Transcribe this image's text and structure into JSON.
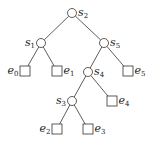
{
  "diagram": {
    "type": "binary-tree",
    "internal_nodes": [
      {
        "id": "s2",
        "base": "s",
        "sub": "2",
        "x": 72,
        "y": 13,
        "label_side": "right"
      },
      {
        "id": "s1",
        "base": "s",
        "sub": "1",
        "x": 41,
        "y": 43,
        "label_side": "left"
      },
      {
        "id": "s5",
        "base": "s",
        "sub": "5",
        "x": 104,
        "y": 43,
        "label_side": "right"
      },
      {
        "id": "s4",
        "base": "s",
        "sub": "4",
        "x": 88,
        "y": 72,
        "label_side": "right"
      },
      {
        "id": "s3",
        "base": "s",
        "sub": "3",
        "x": 72,
        "y": 101,
        "label_side": "left"
      }
    ],
    "leaves": [
      {
        "id": "e0",
        "base": "e",
        "sub": "0",
        "x": 25,
        "y": 71,
        "label_side": "left"
      },
      {
        "id": "e1",
        "base": "e",
        "sub": "1",
        "x": 57,
        "y": 71,
        "label_side": "right"
      },
      {
        "id": "e5",
        "base": "e",
        "sub": "5",
        "x": 128,
        "y": 71,
        "label_side": "right"
      },
      {
        "id": "e4",
        "base": "e",
        "sub": "4",
        "x": 112,
        "y": 101,
        "label_side": "right"
      },
      {
        "id": "e2",
        "base": "e",
        "sub": "2",
        "x": 57,
        "y": 129,
        "label_side": "left"
      },
      {
        "id": "e3",
        "base": "e",
        "sub": "3",
        "x": 88,
        "y": 129,
        "label_side": "right"
      }
    ],
    "edges": [
      [
        "s2",
        "s1"
      ],
      [
        "s2",
        "s5"
      ],
      [
        "s1",
        "e0"
      ],
      [
        "s1",
        "e1"
      ],
      [
        "s5",
        "s4"
      ],
      [
        "s5",
        "e5"
      ],
      [
        "s4",
        "s3"
      ],
      [
        "s4",
        "e4"
      ],
      [
        "s3",
        "e2"
      ],
      [
        "s3",
        "e3"
      ]
    ]
  }
}
